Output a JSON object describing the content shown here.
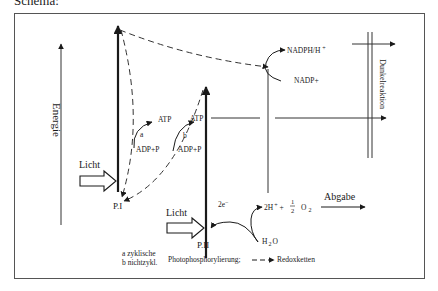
{
  "heading": "Schema:",
  "axis_left": {
    "label": "Energie"
  },
  "axis_right": {
    "label": "Dunkelreaktion"
  },
  "photosystems": {
    "p1": "P.I",
    "p2": "P.II"
  },
  "light": {
    "p1": "Licht",
    "p2": "Licht"
  },
  "atp": {
    "a_label": "a",
    "b_label": "b",
    "atp_a": "ATP",
    "adp_a": "ADP+P",
    "atp_b": "ATP",
    "adp_b": "ADP+P"
  },
  "nadp": {
    "product": "NADPH/H",
    "product_sup": "+",
    "substrate": "NADP+"
  },
  "water": {
    "electrons": "2e",
    "electrons_sup": "−",
    "h_plus": "2H",
    "h_plus_sup": "+",
    "plus": "+",
    "half_num": "1",
    "half_den": "2",
    "o2": "O",
    "o2_sub": "2",
    "h2o_h": "H",
    "h2o_sub": "2",
    "h2o_o": "O",
    "release": "Abgabe"
  },
  "legend": {
    "line1": "a zyklische",
    "line2": "b nichtzykl.",
    "phospho": "Photophosphorylierung;",
    "redox": "Redoxketten"
  }
}
